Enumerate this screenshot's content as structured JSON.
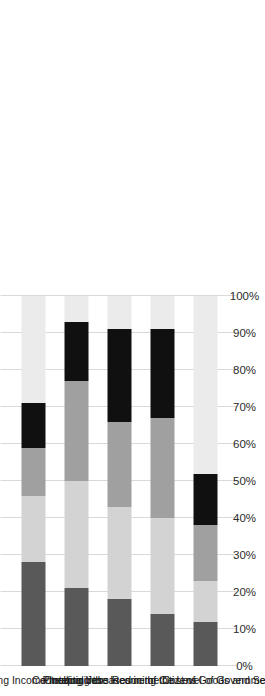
{
  "chart_data": {
    "type": "bar",
    "subtype": "stacked-100-percent-horizontal",
    "title": "",
    "subtitle": "",
    "xlabel": "",
    "ylabel": "",
    "xlim": [
      0,
      100
    ],
    "grid": true,
    "orientation": "rotated-90-clockwise",
    "legend_position": "bottom",
    "tick_labels": [
      "0%",
      "10%",
      "20%",
      "30%",
      "40%",
      "50%",
      "60%",
      "70%",
      "80%",
      "90%",
      "100%"
    ],
    "tick_values": [
      0,
      10,
      20,
      30,
      40,
      50,
      60,
      70,
      80,
      90,
      100
    ],
    "categories": [
      "Reducing Income Inequalities",
      "Creating Jobs",
      "Protecting the Income of Citizens",
      "Controlling Increases in the Cost of Goods and Services",
      "Reducing the Level of Government Debt"
    ],
    "series": [
      {
        "name": "Most Important",
        "color": "#595959",
        "values": [
          28,
          21,
          18,
          14,
          12
        ]
      },
      {
        "name": "Second Most Important",
        "color": "#d3d3d3",
        "values": [
          18,
          29,
          25,
          26,
          11
        ]
      },
      {
        "name": "Third Most Important",
        "color": "#a0a0a0",
        "values": [
          13,
          27,
          23,
          27,
          15
        ]
      },
      {
        "name": "Fourth Most Important",
        "color": "#101010",
        "values": [
          12,
          16,
          25,
          24,
          14
        ]
      },
      {
        "name": "Remaining",
        "color": "#ebebeb",
        "values": [
          29,
          7,
          9,
          9,
          48
        ]
      }
    ]
  }
}
